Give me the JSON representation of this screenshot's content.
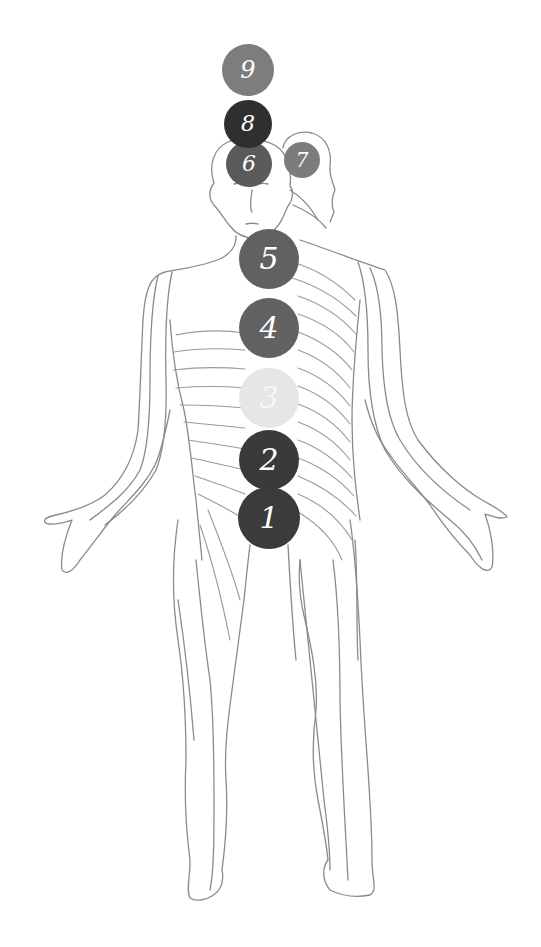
{
  "figure": {
    "line_color": "#8a8a8a",
    "background": "#ffffff"
  },
  "points": [
    {
      "label": "1",
      "cx": 269,
      "cy": 518,
      "r": 31,
      "color": "#3b3b3b"
    },
    {
      "label": "2",
      "cx": 269,
      "cy": 460,
      "r": 30,
      "color": "#3a3a3a"
    },
    {
      "label": "3",
      "cx": 269,
      "cy": 398,
      "r": 30,
      "color": "#e6e6e6"
    },
    {
      "label": "4",
      "cx": 269,
      "cy": 328,
      "r": 30,
      "color": "#626262"
    },
    {
      "label": "5",
      "cx": 269,
      "cy": 259,
      "r": 30,
      "color": "#616161"
    },
    {
      "label": "6",
      "cx": 249,
      "cy": 164,
      "r": 23,
      "color": "#5a5a5a"
    },
    {
      "label": "7",
      "cx": 302,
      "cy": 160,
      "r": 18,
      "color": "#7c7c7c"
    },
    {
      "label": "8",
      "cx": 248,
      "cy": 124,
      "r": 24,
      "color": "#2f2f2f"
    },
    {
      "label": "9",
      "cx": 248,
      "cy": 70,
      "r": 26,
      "color": "#7d7d7d"
    }
  ]
}
